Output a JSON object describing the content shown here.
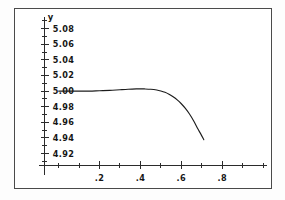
{
  "figure": {
    "background_color": "#ffffff",
    "frame_color": "#4a4a4a",
    "ink_color": "#1c1c1c"
  },
  "chart_data": {
    "type": "line",
    "title": "",
    "subtitle": "",
    "xlabel": "",
    "ylabel": "y",
    "xlim": [
      0.0,
      1.0
    ],
    "ylim": [
      4.905,
      5.09
    ],
    "grid": false,
    "legend": null,
    "axis_style": "interior-cross-axes",
    "y_ticks": [
      {
        "value": 5.08,
        "label": "5.08"
      },
      {
        "value": 5.06,
        "label": "5.06"
      },
      {
        "value": 5.04,
        "label": "5.04"
      },
      {
        "value": 5.02,
        "label": "5.02"
      },
      {
        "value": 5.0,
        "label": "5.00"
      },
      {
        "value": 4.98,
        "label": "4.98"
      },
      {
        "value": 4.96,
        "label": "4.96"
      },
      {
        "value": 4.94,
        "label": "4.94"
      },
      {
        "value": 4.92,
        "label": "4.92"
      }
    ],
    "y_minor_ticks": [
      5.09,
      5.07,
      5.05,
      5.03,
      5.01,
      4.99,
      4.97,
      4.95,
      4.93,
      4.91
    ],
    "x_ticks": [
      {
        "value": 0.2,
        "label": ".2"
      },
      {
        "value": 0.4,
        "label": ".4"
      },
      {
        "value": 0.6,
        "label": ".6"
      },
      {
        "value": 0.8,
        "label": ".8"
      }
    ],
    "x_minor_ticks": [
      0.0,
      0.1,
      0.3,
      0.5,
      0.7,
      0.9,
      1.0
    ],
    "series": [
      {
        "name": "y(x)",
        "color": "#1c1c1c",
        "x": [
          0.0,
          0.05,
          0.1,
          0.15,
          0.2,
          0.25,
          0.3,
          0.34,
          0.38,
          0.4,
          0.42,
          0.45,
          0.48,
          0.5,
          0.52,
          0.54,
          0.56,
          0.58,
          0.6,
          0.62,
          0.64,
          0.66,
          0.68,
          0.695,
          0.71
        ],
        "y": [
          5.0,
          5.0,
          5.0,
          5.0,
          5.0005,
          5.001,
          5.0018,
          5.0024,
          5.0028,
          5.0029,
          5.0028,
          5.0024,
          5.0014,
          5.0002,
          4.9985,
          4.996,
          4.9928,
          4.9888,
          4.9838,
          4.9778,
          4.9706,
          4.962,
          4.952,
          4.9452,
          4.9378
        ]
      }
    ],
    "annotations": []
  }
}
